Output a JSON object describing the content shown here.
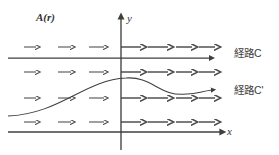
{
  "figure": {
    "kind": "vector-field-path-diagram",
    "background_color": "#ffffff",
    "stroke_color": "#3f3f3f",
    "field_arrow_color": "#4a4a4a",
    "width": 279,
    "height": 155
  },
  "labels": {
    "field": "A(r)",
    "y_axis": "y",
    "x_axis": "x",
    "path_c": "経路C",
    "path_c_prime": "経路C'"
  },
  "axes": {
    "y_axis_x": 121,
    "x_axis_y": 132,
    "y_axis_top": 18,
    "y_axis_bottom": 150,
    "x_axis_left": 8,
    "x_axis_right": 221
  },
  "paths": {
    "c": {
      "type": "straight-horizontal",
      "y": 58,
      "x_start": 8,
      "x_end": 210,
      "arrowhead": true
    },
    "c_prime": {
      "type": "curved",
      "x_start": 8,
      "x_end": 212,
      "y_start": 116,
      "peak_x": 126,
      "peak_y": 78,
      "trough_x": 186,
      "trough_y": 94,
      "y_end": 90,
      "arrowhead": true
    }
  },
  "field_rows": [
    {
      "y": 47,
      "arrows": [
        {
          "x1": 24,
          "x2": 36
        },
        {
          "x1": 58,
          "x2": 71
        },
        {
          "x1": 89,
          "x2": 104
        },
        {
          "x1": 121,
          "x2": 141
        },
        {
          "x1": 148,
          "x2": 168
        },
        {
          "x1": 176,
          "x2": 192
        },
        {
          "x1": 199,
          "x2": 215
        }
      ]
    },
    {
      "y": 72,
      "arrows": [
        {
          "x1": 24,
          "x2": 36
        },
        {
          "x1": 58,
          "x2": 71
        },
        {
          "x1": 89,
          "x2": 104
        },
        {
          "x1": 121,
          "x2": 141
        },
        {
          "x1": 148,
          "x2": 168
        },
        {
          "x1": 176,
          "x2": 192
        },
        {
          "x1": 199,
          "x2": 215
        }
      ]
    },
    {
      "y": 98,
      "arrows": [
        {
          "x1": 24,
          "x2": 36
        },
        {
          "x1": 58,
          "x2": 71
        },
        {
          "x1": 89,
          "x2": 104
        },
        {
          "x1": 121,
          "x2": 141
        },
        {
          "x1": 148,
          "x2": 168
        },
        {
          "x1": 176,
          "x2": 192
        },
        {
          "x1": 199,
          "x2": 215
        }
      ]
    },
    {
      "y": 122,
      "arrows": [
        {
          "x1": 24,
          "x2": 36
        },
        {
          "x1": 58,
          "x2": 71
        },
        {
          "x1": 89,
          "x2": 104
        },
        {
          "x1": 121,
          "x2": 141
        },
        {
          "x1": 148,
          "x2": 168
        },
        {
          "x1": 176,
          "x2": 192
        },
        {
          "x1": 199,
          "x2": 215
        }
      ]
    }
  ],
  "label_positions": {
    "field": {
      "left": 36,
      "top": 12
    },
    "y_axis": {
      "left": 127,
      "top": 13
    },
    "x_axis": {
      "left": 227,
      "top": 126
    },
    "path_c": {
      "left": 234,
      "top": 48
    },
    "path_c_prime": {
      "left": 234,
      "top": 85
    }
  }
}
